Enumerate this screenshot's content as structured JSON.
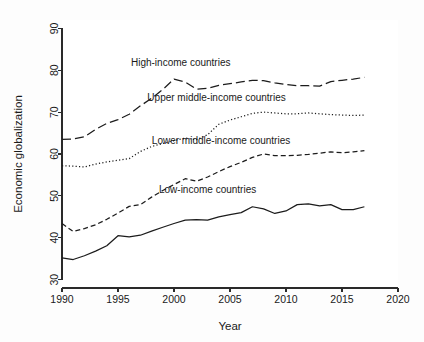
{
  "chart_data": {
    "type": "line",
    "title": "",
    "xlabel": "Year",
    "ylabel": "Economic globalization",
    "xlim": [
      1990,
      2020
    ],
    "ylim": [
      28,
      92
    ],
    "xticks": [
      1990,
      1995,
      2000,
      2005,
      2010,
      2015,
      2020
    ],
    "yticks": [
      30,
      40,
      50,
      60,
      70,
      80,
      90
    ],
    "grid": false,
    "legend_position": "inline-annotations",
    "x": [
      1990,
      1991,
      1992,
      1993,
      1994,
      1995,
      1996,
      1997,
      1998,
      1999,
      2000,
      2001,
      2002,
      2003,
      2004,
      2005,
      2006,
      2007,
      2008,
      2009,
      2010,
      2011,
      2012,
      2013,
      2014,
      2015,
      2016,
      2017
    ],
    "series": [
      {
        "name": "High-income countries",
        "label": "High-income countries",
        "dash": "long-dash",
        "color": "#1c1c1c",
        "label_x": 2000.6,
        "label_y": 80.9,
        "values": [
          63.5,
          63.6,
          64.1,
          65.9,
          67.3,
          68.2,
          69.5,
          71.5,
          73.3,
          75.4,
          77.9,
          77.2,
          75.5,
          75.7,
          76.4,
          76.8,
          77.2,
          77.6,
          77.5,
          77.0,
          76.6,
          76.3,
          76.3,
          76.2,
          77.3,
          77.6,
          77.9,
          78.3
        ]
      },
      {
        "name": "Upper middle-income countries",
        "label": "Upper middle-income countries",
        "dash": "dotted",
        "color": "#1c1c1c",
        "label_x": 2003.8,
        "label_y": 72.6,
        "values": [
          57.2,
          57.1,
          56.9,
          57.6,
          58.1,
          58.5,
          58.9,
          60.6,
          61.8,
          62.5,
          63.2,
          63.8,
          63.4,
          64.6,
          67.1,
          68.1,
          68.9,
          69.7,
          70.0,
          69.8,
          69.6,
          69.6,
          69.8,
          69.6,
          69.4,
          69.3,
          69.2,
          69.3
        ]
      },
      {
        "name": "Lower middle-income countries",
        "label": "Lower middle-income countries",
        "dash": "dash",
        "color": "#1c1c1c",
        "label_x": 2004.2,
        "label_y": 62.4,
        "values": [
          43.4,
          41.5,
          42.2,
          43.1,
          44.4,
          45.9,
          47.5,
          47.9,
          49.7,
          51.3,
          52.7,
          54.1,
          53.5,
          54.5,
          55.8,
          57.0,
          58.0,
          59.2,
          60.0,
          59.6,
          59.6,
          59.7,
          59.9,
          60.2,
          60.5,
          60.3,
          60.5,
          60.8
        ]
      },
      {
        "name": "Low-income countries",
        "label": "Low-income countries",
        "dash": "solid",
        "color": "#1c1c1c",
        "label_x": 2003.0,
        "label_y": 50.6,
        "values": [
          35.2,
          34.8,
          35.7,
          36.8,
          38.1,
          40.5,
          40.2,
          40.6,
          41.6,
          42.5,
          43.4,
          44.2,
          44.3,
          44.2,
          45.0,
          45.5,
          46.0,
          47.4,
          46.9,
          45.8,
          46.4,
          47.9,
          48.1,
          47.6,
          47.9,
          46.7,
          46.7,
          47.4
        ]
      }
    ]
  },
  "axes": {
    "x_title": "Year",
    "y_title": "Economic globalization"
  }
}
